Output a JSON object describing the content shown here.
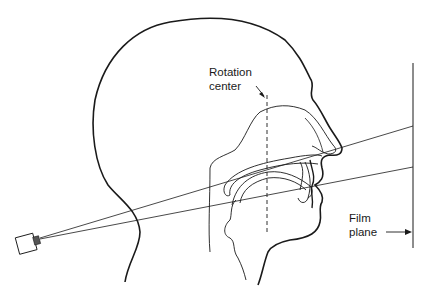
{
  "figure": {
    "type": "diagram",
    "labels": {
      "rotation_center_line1": "Rotation",
      "rotation_center_line2": "center",
      "film_plane_line1": "Film",
      "film_plane_line2": "plane"
    },
    "elements": [
      "x-ray-source",
      "head-outline",
      "rotation-center-axis",
      "beam-rays",
      "film-plane"
    ],
    "colors": {
      "stroke": "#1a1a1a",
      "background": "#ffffff"
    }
  }
}
